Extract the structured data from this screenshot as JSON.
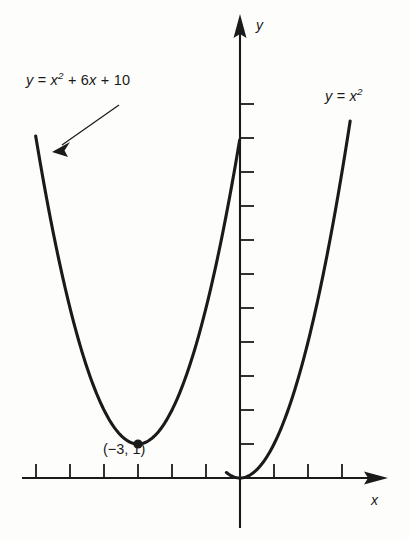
{
  "figure": {
    "background_color": "#fdfdfb",
    "ink_color": "#1a1a1a",
    "width": 409,
    "height": 540
  },
  "labels": {
    "curve_b_prefix": "y = x",
    "curve_b_exp": "2",
    "curve_b_suffix": " + 6x + 10",
    "curve_b_full": "y = x2 + 6x + 10",
    "curve_a_prefix": "y = x",
    "curve_a_exp": "2",
    "curve_a_full": "y = x2",
    "vertex_point": "(−3, 1)",
    "axis_x": "x",
    "axis_y": "y"
  },
  "chart_data": {
    "type": "line",
    "title": "",
    "subtitle": "",
    "xlabel": "x",
    "ylabel": "y",
    "grid": false,
    "legend_position": "inline-annotation",
    "axes": {
      "origin_px": [
        240,
        478
      ],
      "unit_px": 34,
      "x_axis_visible_range": [
        -6,
        3
      ],
      "y_axis_visible_range": [
        -1,
        12
      ],
      "x_ticks": [
        -6,
        -5,
        -4,
        -3,
        -2,
        -1,
        1,
        2,
        3
      ],
      "y_ticks": [
        1,
        2,
        3,
        4,
        5,
        6,
        7,
        8,
        9,
        10,
        11
      ],
      "tick_labels_shown": false,
      "x_arrow": "right",
      "y_arrow": "up"
    },
    "series": [
      {
        "name": "y = x2",
        "equation": "y = x^2",
        "vertex": [
          0,
          0
        ],
        "color": "#1a1a1a",
        "points": [
          [
            -0.25,
            0.06
          ],
          [
            0,
            0
          ],
          [
            0.5,
            0.25
          ],
          [
            1,
            1
          ],
          [
            1.5,
            2.25
          ],
          [
            2,
            4
          ],
          [
            2.5,
            6.25
          ],
          [
            3,
            9
          ],
          [
            3.25,
            10.56
          ]
        ]
      },
      {
        "name": "y = x2 + 6x + 10",
        "equation": "y = x^2 + 6x + 10",
        "vertex": [
          -3,
          1
        ],
        "color": "#1a1a1a",
        "points": [
          [
            -6.0,
            10.0
          ],
          [
            -5.5,
            7.25
          ],
          [
            -5.0,
            5.0
          ],
          [
            -4.5,
            3.25
          ],
          [
            -4.0,
            2.0
          ],
          [
            -3.5,
            1.25
          ],
          [
            -3.0,
            1.0
          ],
          [
            -2.5,
            1.25
          ],
          [
            -2.0,
            2.0
          ],
          [
            -1.5,
            3.25
          ],
          [
            -1.0,
            5.0
          ],
          [
            -0.5,
            7.25
          ],
          [
            -0.1,
            9.41
          ],
          [
            0.0,
            10.0
          ],
          [
            0.1,
            10.61
          ]
        ]
      }
    ],
    "annotations": [
      {
        "name": "vertex-marker",
        "text": "(−3, 1)",
        "point": [
          -3,
          1
        ],
        "marker": "filled-circle"
      },
      {
        "name": "curve-b-callout",
        "text": "y = x2 + 6x + 10",
        "arrow_from_px": [
          118,
          106
        ],
        "arrow_to_px": [
          56,
          150
        ]
      },
      {
        "name": "curve-a-callout",
        "text": "y = x2",
        "arrow": false
      }
    ]
  }
}
